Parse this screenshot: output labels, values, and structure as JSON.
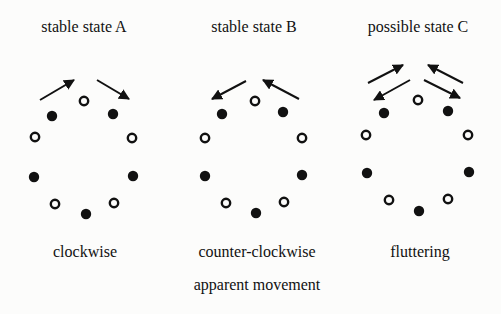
{
  "diagram": {
    "caption": "apparent movement",
    "panels": [
      {
        "title": "stable state A",
        "label": "clockwise",
        "title_x": 84,
        "label_x": 85,
        "dots": [
          {
            "x": 84,
            "y": 101,
            "fill": "open"
          },
          {
            "x": 52,
            "y": 116,
            "fill": "filled"
          },
          {
            "x": 113,
            "y": 114,
            "fill": "filled"
          },
          {
            "x": 35,
            "y": 137,
            "fill": "open"
          },
          {
            "x": 132,
            "y": 138,
            "fill": "open"
          },
          {
            "x": 34,
            "y": 177,
            "fill": "filled"
          },
          {
            "x": 133,
            "y": 176,
            "fill": "filled"
          },
          {
            "x": 55,
            "y": 204,
            "fill": "open"
          },
          {
            "x": 114,
            "y": 203,
            "fill": "open"
          },
          {
            "x": 86,
            "y": 214,
            "fill": "filled"
          }
        ],
        "arrows": [
          {
            "x1": 40,
            "y1": 100,
            "x2": 74,
            "y2": 80
          },
          {
            "x1": 97,
            "y1": 80,
            "x2": 129,
            "y2": 99
          }
        ]
      },
      {
        "title": "stable state B",
        "label": "counter-clockwise",
        "title_x": 254,
        "label_x": 257,
        "dots": [
          {
            "x": 255,
            "y": 101,
            "fill": "open"
          },
          {
            "x": 222,
            "y": 114,
            "fill": "filled"
          },
          {
            "x": 283,
            "y": 112,
            "fill": "filled"
          },
          {
            "x": 205,
            "y": 138,
            "fill": "open"
          },
          {
            "x": 302,
            "y": 138,
            "fill": "open"
          },
          {
            "x": 205,
            "y": 176,
            "fill": "filled"
          },
          {
            "x": 302,
            "y": 175,
            "fill": "filled"
          },
          {
            "x": 226,
            "y": 203,
            "fill": "open"
          },
          {
            "x": 284,
            "y": 202,
            "fill": "open"
          },
          {
            "x": 256,
            "y": 213,
            "fill": "filled"
          }
        ],
        "arrows": [
          {
            "x1": 246,
            "y1": 81,
            "x2": 212,
            "y2": 99
          },
          {
            "x1": 299,
            "y1": 99,
            "x2": 263,
            "y2": 80
          }
        ]
      },
      {
        "title": "possible state C",
        "label": "fluttering",
        "title_x": 418,
        "label_x": 420,
        "dots": [
          {
            "x": 418,
            "y": 100,
            "fill": "open"
          },
          {
            "x": 384,
            "y": 113,
            "fill": "filled"
          },
          {
            "x": 448,
            "y": 111,
            "fill": "filled"
          },
          {
            "x": 366,
            "y": 135,
            "fill": "open"
          },
          {
            "x": 468,
            "y": 135,
            "fill": "open"
          },
          {
            "x": 367,
            "y": 173,
            "fill": "filled"
          },
          {
            "x": 469,
            "y": 172,
            "fill": "filled"
          },
          {
            "x": 389,
            "y": 200,
            "fill": "open"
          },
          {
            "x": 448,
            "y": 199,
            "fill": "open"
          },
          {
            "x": 419,
            "y": 211,
            "fill": "filled"
          }
        ],
        "arrows": [
          {
            "x1": 368,
            "y1": 83,
            "x2": 403,
            "y2": 65
          },
          {
            "x1": 410,
            "y1": 80,
            "x2": 374,
            "y2": 100
          },
          {
            "x1": 463,
            "y1": 83,
            "x2": 428,
            "y2": 65
          },
          {
            "x1": 424,
            "y1": 80,
            "x2": 460,
            "y2": 98
          }
        ]
      }
    ],
    "colors": {
      "ink": "#111111",
      "background": "#fcfcfb"
    }
  }
}
